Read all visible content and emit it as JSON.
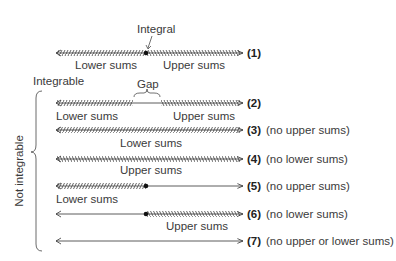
{
  "diagram": {
    "annotations": {
      "integral": "Integral",
      "integrable": "Integrable",
      "gap": "Gap",
      "not_integrable": "Not integrable"
    },
    "rows": [
      {
        "id": "(1)",
        "note": "",
        "lower_label": "Lower sums",
        "upper_label": "Upper sums",
        "lower": true,
        "upper": true,
        "dot": true,
        "gap": false
      },
      {
        "id": "(2)",
        "note": "",
        "lower_label": "Lower sums",
        "upper_label": "Upper sums",
        "lower": true,
        "upper": true,
        "dot": false,
        "gap": true
      },
      {
        "id": "(3)",
        "note": "(no upper sums)",
        "lower_label": "Lower sums",
        "upper_label": "",
        "lower": true,
        "upper": false,
        "dot": false,
        "gap": false
      },
      {
        "id": "(4)",
        "note": "(no lower sums)",
        "lower_label": "",
        "upper_label": "Upper sums",
        "lower": false,
        "upper": true,
        "dot": false,
        "gap": false
      },
      {
        "id": "(5)",
        "note": "(no upper sums)",
        "lower_label": "Lower sums",
        "upper_label": "",
        "lower": true,
        "upper": false,
        "dot": true,
        "gap": false
      },
      {
        "id": "(6)",
        "note": "(no lower sums)",
        "lower_label": "",
        "upper_label": "Upper sums",
        "lower": false,
        "upper": true,
        "dot": true,
        "gap": false
      },
      {
        "id": "(7)",
        "note": "(no upper or lower sums)",
        "lower_label": "",
        "upper_label": "",
        "lower": false,
        "upper": false,
        "dot": false,
        "gap": false
      }
    ],
    "colors": {
      "line": "#333333",
      "hatch": "#555555"
    }
  }
}
